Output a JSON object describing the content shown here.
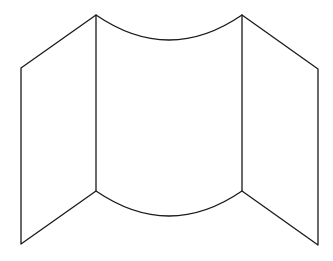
{
  "diagram": {
    "stroke_color": "#1a1a1a",
    "background": "#ffffff",
    "panels": [
      {
        "name": "left-panel",
        "points": [
          [
            21,
            68
          ],
          [
            96,
            15
          ],
          [
            96,
            191
          ],
          [
            21,
            244
          ]
        ]
      },
      {
        "name": "center-panel",
        "top_curve_dip_y": 39,
        "bottom_curve_dip_y": 215,
        "left_x": 96,
        "right_x": 242
      },
      {
        "name": "right-panel",
        "points": [
          [
            242,
            15
          ],
          [
            318,
            69
          ],
          [
            318,
            245
          ],
          [
            242,
            191
          ]
        ]
      }
    ]
  }
}
